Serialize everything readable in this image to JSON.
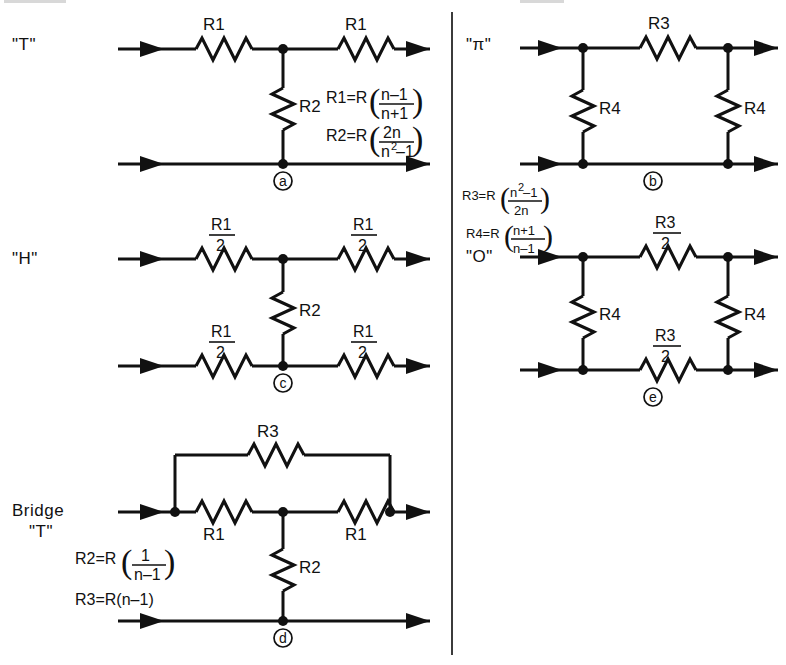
{
  "page": {
    "background": "#ffffff",
    "ink_color": "#111111",
    "divider_x": 452
  },
  "networks": [
    {
      "id": "t-network",
      "name": "T attenuator",
      "label": "\"T\"",
      "mark": "a",
      "series_left_label": "R1",
      "series_right_label": "R1",
      "shunt_label": "R2",
      "formulas": [
        {
          "lhs": "R1=R",
          "num": "n–1",
          "den": "n+1"
        },
        {
          "lhs": "R2=R",
          "num": "2n",
          "den": "n–1",
          "den_sup": "2",
          "den_base": "n"
        }
      ]
    },
    {
      "id": "pi-network",
      "name": "Pi attenuator",
      "label": "\"π\"",
      "mark": "b",
      "series_label": "R3",
      "shunt_left_label": "R4",
      "shunt_right_label": "R4",
      "formulas": [
        {
          "lhs": "R3=R",
          "num": "n –1",
          "num_sup": "2",
          "num_base": "n",
          "den": "2n"
        },
        {
          "lhs": "R4=R",
          "num": "n+1",
          "den": "n–1"
        }
      ]
    },
    {
      "id": "h-network",
      "name": "H attenuator",
      "label": "\"H\"",
      "mark": "c",
      "shunt_label": "R2",
      "arm_label_num": "R1",
      "arm_label_den": "2",
      "arms": [
        "top-left",
        "top-right",
        "bottom-left",
        "bottom-right"
      ]
    },
    {
      "id": "o-network",
      "name": "O attenuator",
      "label": "\"O\"",
      "mark": "e",
      "series_label_num": "R3",
      "series_label_den": "2",
      "shunt_left_label": "R4",
      "shunt_right_label": "R4"
    },
    {
      "id": "bridge-t-network",
      "name": "Bridge T attenuator",
      "label_line1": "Bridge",
      "label_line2": "\"T\"",
      "mark": "d",
      "bridge_label": "R3",
      "series_left_label": "R1",
      "series_right_label": "R1",
      "shunt_label": "R2",
      "formulas": [
        {
          "lhs": "R2=R",
          "num": "1",
          "den": "n–1"
        },
        {
          "lhs": "R3=R(n–1)",
          "inline": true
        }
      ]
    }
  ],
  "symbols": {
    "resistor": "zigzag-resistor",
    "node": "junction-dot",
    "arrow": "signal-arrow",
    "circle_mark": "figure-reference-circle"
  }
}
